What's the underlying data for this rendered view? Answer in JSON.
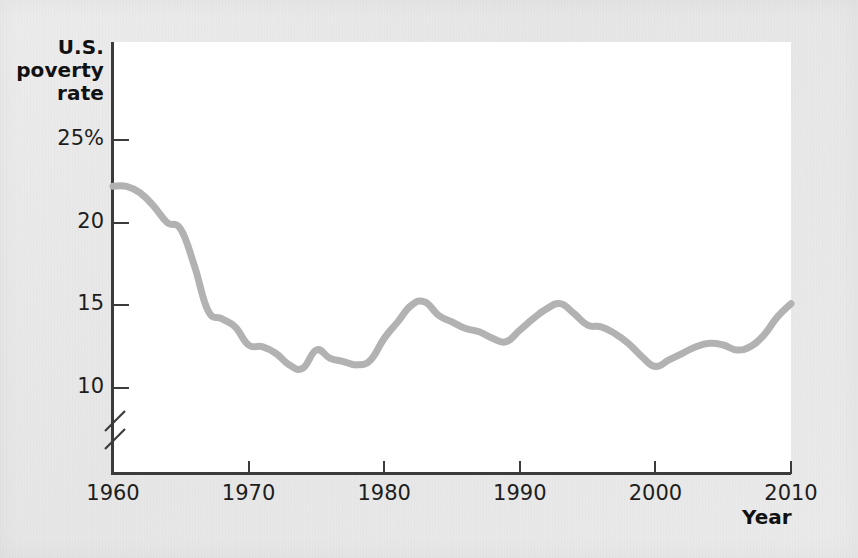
{
  "chart_data": {
    "type": "line",
    "title": "",
    "ylabel": "U.S. poverty rate",
    "xlabel": "Year",
    "x_tick_labels": [
      "1960",
      "1970",
      "1980",
      "1990",
      "2000",
      "2010"
    ],
    "x_ticks": [
      1960,
      1970,
      1980,
      1990,
      2000,
      2010
    ],
    "y_tick_labels": [
      "25%",
      "20",
      "15",
      "10"
    ],
    "y_ticks": [
      25,
      20,
      15,
      10
    ],
    "xlim": [
      1960,
      2010
    ],
    "ylim": [
      8.8,
      25
    ],
    "y_axis_break": true,
    "grid": false,
    "legend": false,
    "line_color": "#b2b2b2",
    "line_width_px": 7,
    "series": [
      {
        "name": "U.S. poverty rate",
        "x": [
          1960,
          1961,
          1962,
          1963,
          1964,
          1965,
          1966,
          1967,
          1968,
          1969,
          1970,
          1971,
          1972,
          1973,
          1974,
          1975,
          1976,
          1977,
          1978,
          1979,
          1980,
          1981,
          1982,
          1983,
          1984,
          1985,
          1986,
          1987,
          1988,
          1989,
          1990,
          1991,
          1992,
          1993,
          1994,
          1995,
          1996,
          1997,
          1998,
          1999,
          2000,
          2001,
          2002,
          2003,
          2004,
          2005,
          2006,
          2007,
          2008,
          2009,
          2010
        ],
        "values": [
          22.2,
          22.2,
          21.8,
          21.0,
          20.0,
          19.6,
          17.4,
          14.7,
          14.2,
          13.7,
          12.6,
          12.5,
          12.1,
          11.4,
          11.2,
          12.3,
          11.8,
          11.6,
          11.4,
          11.7,
          13.0,
          14.0,
          15.0,
          15.2,
          14.4,
          14.0,
          13.6,
          13.4,
          13.0,
          12.8,
          13.5,
          14.2,
          14.8,
          15.1,
          14.5,
          13.8,
          13.7,
          13.3,
          12.7,
          11.9,
          11.3,
          11.7,
          12.1,
          12.5,
          12.7,
          12.6,
          12.3,
          12.5,
          13.2,
          14.3,
          15.1
        ]
      }
    ]
  },
  "figure": {
    "background_color": "#e9e9e9",
    "plot_background_color": "#ffffff",
    "axis_color": "#3b3b3b"
  }
}
